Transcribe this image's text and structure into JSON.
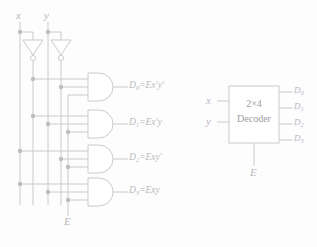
{
  "figure": {
    "line_color": "#c9c9cd",
    "text_color": "#b9b9bd",
    "background": "#fdfdfd"
  },
  "gate_circuit": {
    "inputs": [
      {
        "name": "input-x",
        "label": "x"
      },
      {
        "name": "input-y",
        "label": "y"
      }
    ],
    "enable": {
      "label": "E"
    },
    "inverters": [
      {
        "name": "inverter-x",
        "input": "x",
        "output": "x'"
      },
      {
        "name": "inverter-y",
        "input": "y",
        "output": "y'"
      }
    ],
    "and_gates": [
      {
        "output": "D",
        "index": "0",
        "equation": "=Ex′y′",
        "terms": [
          "E",
          "x′",
          "y′"
        ]
      },
      {
        "output": "D",
        "index": "1",
        "equation": "=Ex′y",
        "terms": [
          "E",
          "x′",
          "y"
        ]
      },
      {
        "output": "D",
        "index": "2",
        "equation": "=Exy′",
        "terms": [
          "E",
          "x",
          "y′"
        ]
      },
      {
        "output": "D",
        "index": "3",
        "equation": "=Exy",
        "terms": [
          "E",
          "x",
          "y"
        ]
      }
    ]
  },
  "block_symbol": {
    "title_line1": "2×4",
    "title_line2": "Decoder",
    "inputs": [
      {
        "label": "x"
      },
      {
        "label": "y"
      }
    ],
    "enable": {
      "label": "E"
    },
    "outputs": [
      {
        "label": "D",
        "index": "0"
      },
      {
        "label": "D",
        "index": "1"
      },
      {
        "label": "D",
        "index": "2"
      },
      {
        "label": "D",
        "index": "3"
      }
    ]
  }
}
